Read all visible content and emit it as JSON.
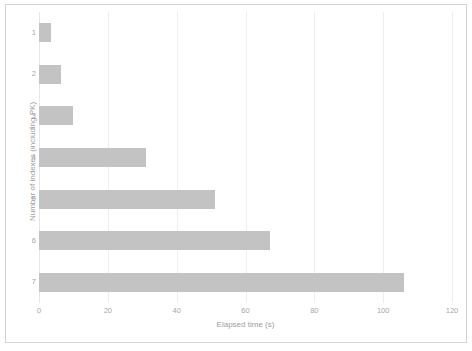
{
  "chart_data": {
    "type": "bar",
    "orientation": "horizontal",
    "title": "",
    "xlabel": "Elapsed time (s)",
    "ylabel": "Number of indexes (including PK)",
    "categories": [
      "1",
      "2",
      "3",
      "4",
      "5",
      "6",
      "7"
    ],
    "values": [
      3.5,
      6.5,
      10,
      31,
      51,
      67,
      106
    ],
    "xlim": [
      0,
      120
    ],
    "xticks": [
      "0",
      "20",
      "40",
      "60",
      "80",
      "100",
      "120"
    ],
    "xtick_values": [
      0,
      20,
      40,
      60,
      80,
      100,
      120
    ],
    "grid": "vertical",
    "legend": "none",
    "series": [
      {
        "name": "Elapsed time (s)",
        "values": [
          3.5,
          6.5,
          10,
          31,
          51,
          67,
          106
        ],
        "color": "#c3c3c3"
      }
    ]
  },
  "axes": {
    "x_title": "Elapsed time (s)",
    "y_title": "Number of indexes (including PK)"
  },
  "colors": {
    "bar": "#c3c3c3",
    "gridline": "#eeeeee",
    "tick_text": "#a8a8a8",
    "axis_title": "#a0a0a0",
    "frame": "#d4d4d4",
    "background": "#ffffff"
  }
}
